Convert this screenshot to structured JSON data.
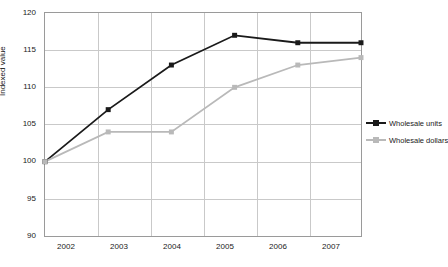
{
  "chart_data": {
    "type": "line",
    "title": "",
    "xlabel": "",
    "ylabel": "Indexed value",
    "categories": [
      "2002",
      "2003",
      "2004",
      "2005",
      "2006",
      "2007"
    ],
    "ylim": [
      90,
      120
    ],
    "yticks": [
      "90",
      "95",
      "100",
      "105",
      "110",
      "115",
      "120"
    ],
    "grid": true,
    "legend_position": "right",
    "series": [
      {
        "name": "Wholesale units",
        "color": "#1a1a1a",
        "values": [
          100,
          107,
          113,
          117,
          116,
          116
        ]
      },
      {
        "name": "Wholesale dollars",
        "color": "#b9b9b9",
        "values": [
          100,
          104,
          104,
          110,
          113,
          114
        ]
      }
    ]
  }
}
